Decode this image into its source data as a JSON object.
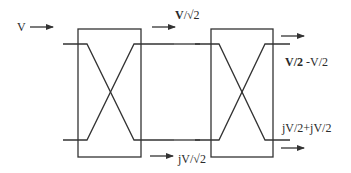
{
  "diagram": {
    "labels": {
      "input": "V",
      "mid_top": "V/√2",
      "mid_top_bold_part": "V",
      "mid_bottom": "jV/√2",
      "out_top": "V/2 -V/2",
      "out_top_bold_part": "V/2",
      "out_top_rest": " -V/2",
      "out_bottom": "jV/2+jV/2"
    },
    "colors": {
      "line": "#333333",
      "background": "#ffffff"
    },
    "blocks": [
      {
        "name": "coupler-1",
        "x": 78,
        "y": 29,
        "w": 63,
        "h": 128
      },
      {
        "name": "coupler-2",
        "x": 211,
        "y": 29,
        "w": 62,
        "h": 128
      }
    ]
  }
}
